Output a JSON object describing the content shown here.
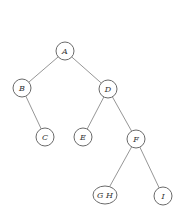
{
  "diagram": {
    "type": "binary-tree",
    "colors": {
      "edge": "#8a8a8a",
      "node_stroke": "#6a6a6a",
      "label": "#333333",
      "background": "#ffffff"
    },
    "nodes": [
      {
        "id": "A",
        "label": "A",
        "cx": 65,
        "cy": 51,
        "rx": 9,
        "ry": 9
      },
      {
        "id": "B",
        "label": "B",
        "cx": 22,
        "cy": 88,
        "rx": 9,
        "ry": 9
      },
      {
        "id": "D",
        "label": "D",
        "cx": 108,
        "cy": 89,
        "rx": 9,
        "ry": 9
      },
      {
        "id": "C",
        "label": "C",
        "cx": 45,
        "cy": 137,
        "rx": 9,
        "ry": 9
      },
      {
        "id": "E",
        "label": "E",
        "cx": 83,
        "cy": 137,
        "rx": 9,
        "ry": 9
      },
      {
        "id": "F",
        "label": "F",
        "cx": 136,
        "cy": 139,
        "rx": 9,
        "ry": 9
      },
      {
        "id": "GH",
        "label": "G H",
        "cx": 105,
        "cy": 195,
        "rx": 12,
        "ry": 9
      },
      {
        "id": "I",
        "label": "I",
        "cx": 163,
        "cy": 196,
        "rx": 9,
        "ry": 9
      }
    ],
    "edges": [
      {
        "from": "A",
        "to": "B"
      },
      {
        "from": "A",
        "to": "D"
      },
      {
        "from": "B",
        "to": "C"
      },
      {
        "from": "D",
        "to": "E"
      },
      {
        "from": "D",
        "to": "F"
      },
      {
        "from": "F",
        "to": "GH"
      },
      {
        "from": "F",
        "to": "I"
      }
    ]
  }
}
